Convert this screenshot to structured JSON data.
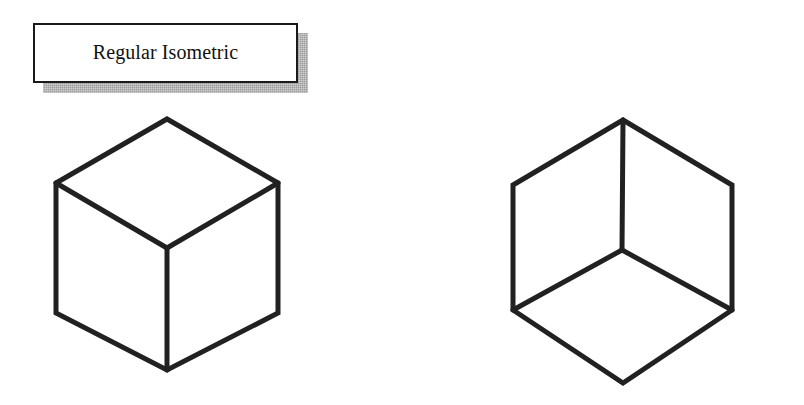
{
  "figure": {
    "background_color": "#ffffff",
    "ink_color": "#212121",
    "shadow_color": "#9d9d9d",
    "plate_fill": "#ffffff",
    "plate_border_color": "#1a1a1a",
    "width": 804,
    "height": 405
  },
  "panels": [
    {
      "id": "regular",
      "label": "Regular Isometric",
      "cube": {
        "name": "regular-isometric-cube",
        "reading": "viewed-from-above",
        "hexagon_points": "167,119 278,183 278,313 167,370 56,313 56,183",
        "junction_center": "167,248",
        "junction_arm_left": "56,183",
        "junction_arm_right": "278,183",
        "junction_stem": "167,370",
        "top_vertex": "167,119",
        "bottom_vertex": "167,370",
        "left_edge_x": 56,
        "right_edge_x": 278
      }
    },
    {
      "id": "reversed",
      "label": "Reversed Isometric",
      "cube": {
        "name": "reversed-isometric-cube",
        "reading": "viewed-from-below",
        "hexagon_points": "623,120 732,185 732,310 623,383 513,310 513,185",
        "junction_center": "622,250",
        "junction_arm_left": "513,310",
        "junction_arm_right": "732,310",
        "junction_stem": "623,120",
        "top_vertex": "623,120",
        "bottom_vertex": "623,383",
        "left_edge_x": 513,
        "right_edge_x": 732
      }
    }
  ]
}
